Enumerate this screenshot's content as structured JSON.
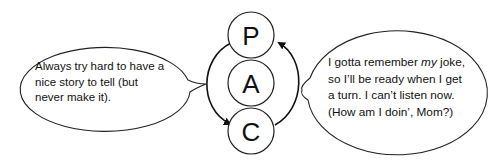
{
  "diagram": {
    "circles": [
      {
        "label": "P",
        "cx": 251,
        "cy": 35
      },
      {
        "label": "A",
        "cx": 251,
        "cy": 83
      },
      {
        "label": "C",
        "cx": 251,
        "cy": 131
      }
    ],
    "left_bubble": {
      "lines": [
        "Always try hard to have a",
        "nice story to tell (but",
        "never make it)."
      ]
    },
    "right_bubble": {
      "line1_pre": "I gotta remember ",
      "line1_em": "my",
      "line1_post": " joke,",
      "line2": "so I’ll be ready when I get",
      "line3": "a turn.  I can’t listen now.",
      "line4": "(How am I doin’, Mom?)"
    },
    "arrows": [
      {
        "from": "P",
        "to": "C",
        "side": "left"
      },
      {
        "from": "C",
        "to": "P",
        "side": "right"
      }
    ]
  }
}
